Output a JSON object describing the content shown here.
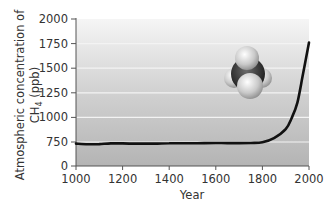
{
  "chart_data": {
    "type": "line",
    "title": "",
    "xlabel": "Year",
    "ylabel": "Atmospheric concentration of CH4 (ppb)",
    "ylabel_lines": [
      "Atmospheric concentration of",
      "CH4 (ppb)"
    ],
    "x_ticks": [
      1000,
      1200,
      1400,
      1600,
      1800,
      2000
    ],
    "y_ticks": [
      0,
      750,
      1000,
      1250,
      1500,
      1750,
      2000
    ],
    "y_axis_break": {
      "from": 0,
      "to": 750
    },
    "xlim": [
      1000,
      2000
    ],
    "ylim": [
      0,
      2000
    ],
    "grid": {
      "horizontal": true,
      "vertical": false
    },
    "legend": null,
    "annotation": "methane-molecule-model",
    "series": [
      {
        "name": "CH4 concentration",
        "x": [
          1000,
          1050,
          1100,
          1150,
          1200,
          1250,
          1300,
          1350,
          1400,
          1450,
          1500,
          1550,
          1600,
          1650,
          1700,
          1750,
          1800,
          1850,
          1900,
          1925,
          1950,
          1975,
          2000
        ],
        "values": [
          700,
          680,
          685,
          705,
          705,
          700,
          700,
          700,
          710,
          710,
          710,
          715,
          720,
          715,
          715,
          720,
          740,
          790,
          880,
          990,
          1150,
          1450,
          1760
        ]
      }
    ]
  },
  "labels": {
    "ylabel_line1": "Atmospheric concentration of",
    "ylabel_ch": "CH",
    "ylabel_sub": "4",
    "ylabel_unit": " (ppb)",
    "xlabel": "Year",
    "yticks": [
      "2000",
      "1750",
      "1500",
      "1250",
      "1000",
      "750",
      "0"
    ],
    "xticks": [
      "1000",
      "1200",
      "1400",
      "1600",
      "1800",
      "2000"
    ]
  },
  "colors": {
    "line": "#111111",
    "plot_bg_top": "#f4f4f4",
    "plot_bg_bottom": "#b8b8b8",
    "grid": "#f2f2f2",
    "axis": "#555555"
  }
}
